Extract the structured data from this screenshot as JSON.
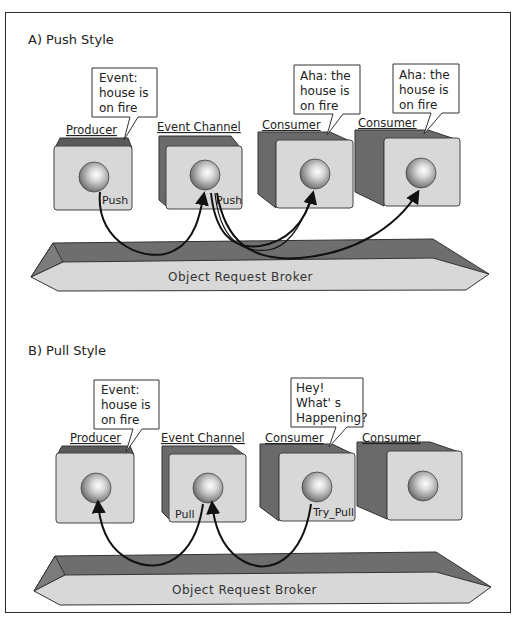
{
  "colors": {
    "box_front": "#d8d8d8",
    "box_side": "#6e6e6e",
    "box_top": "#5a5a5a",
    "orb_front": "#d6d6d6",
    "orb_top": "#6a6a6a",
    "outline": "#333333",
    "arrow": "#111111"
  },
  "push_style": {
    "title": "A)  Push Style",
    "components": [
      {
        "label": "Producer",
        "port": "Push"
      },
      {
        "label": "Event Channel",
        "port": "Push"
      },
      {
        "label": "Consumer",
        "port": ""
      },
      {
        "label": "Consumer",
        "port": ""
      }
    ],
    "bubbles": [
      {
        "lines": [
          "Event:",
          "house is",
          "on fire"
        ]
      },
      {
        "lines": [
          "Aha: the",
          "house is",
          "on fire"
        ]
      },
      {
        "lines": [
          "Aha: the",
          "house is",
          "on fire"
        ]
      }
    ],
    "orb_label": "Object Request Broker"
  },
  "pull_style": {
    "title": "B)  Pull Style",
    "components": [
      {
        "label": "Producer",
        "port": ""
      },
      {
        "label": "Event Channel",
        "port": "Pull"
      },
      {
        "label": "Consumer",
        "port": "Try_Pull"
      },
      {
        "label": "Consumer",
        "port": ""
      }
    ],
    "bubbles": [
      {
        "lines": [
          "Event:",
          "house is",
          "on fire"
        ]
      },
      {
        "lines": [
          "Hey!",
          "What' s",
          "Happening?"
        ]
      }
    ],
    "orb_label": "Object Request Broker"
  }
}
